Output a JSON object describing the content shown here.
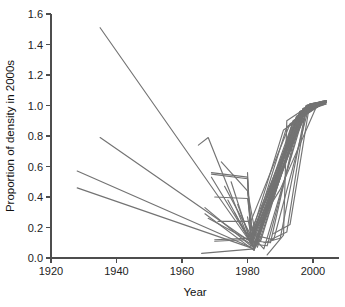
{
  "chart_data": {
    "type": "line",
    "title": "",
    "subtitle": "",
    "xlabel": "Year",
    "ylabel": "Proportion of density in 2000s",
    "xlim": [
      1920,
      2006
    ],
    "ylim": [
      0.0,
      1.6
    ],
    "xticks": [
      1920,
      1940,
      1960,
      1980,
      2000
    ],
    "xticklabels": [
      "1920",
      "1940",
      "1960",
      "1980",
      "2000"
    ],
    "yticks": [
      0.0,
      0.2,
      0.4,
      0.6,
      0.8,
      1.0,
      1.2,
      1.4,
      1.6
    ],
    "yticklabels": [
      "0.0",
      "0.2",
      "0.4",
      "0.6",
      "0.8",
      "1.0",
      "1.2",
      "1.4",
      "1.6"
    ],
    "grid": false,
    "legend": "none",
    "line_color": "#737373",
    "axis_color": "#4d4d4d",
    "background_color": "#ffffff",
    "annotations": [],
    "series": [
      {
        "name": "site-01",
        "x": [
          1935,
          1981,
          1999,
          2004
        ],
        "values": [
          1.51,
          0.1,
          1.01,
          1.03
        ]
      },
      {
        "name": "site-02",
        "x": [
          1928,
          1981,
          1998,
          2004
        ],
        "values": [
          0.57,
          0.07,
          0.99,
          1.02
        ]
      },
      {
        "name": "site-03",
        "x": [
          1928,
          1982,
          1997,
          2004
        ],
        "values": [
          0.46,
          0.06,
          0.97,
          1.01
        ]
      },
      {
        "name": "site-04",
        "x": [
          1935,
          1980,
          1996,
          2003
        ],
        "values": [
          0.79,
          0.12,
          0.95,
          1.02
        ]
      },
      {
        "name": "site-05",
        "x": [
          1965,
          1968,
          1981,
          1997,
          2003
        ],
        "values": [
          0.74,
          0.79,
          0.09,
          0.98,
          1.03
        ]
      },
      {
        "name": "site-06",
        "x": [
          1966,
          1982,
          1995,
          2002
        ],
        "values": [
          0.03,
          0.06,
          0.92,
          1.0
        ]
      },
      {
        "name": "site-07",
        "x": [
          1967,
          1981,
          1996,
          2004
        ],
        "values": [
          0.33,
          0.08,
          0.96,
          1.02
        ]
      },
      {
        "name": "site-08",
        "x": [
          1967,
          1982,
          1998,
          2004
        ],
        "values": [
          0.29,
          0.05,
          1.0,
          1.03
        ]
      },
      {
        "name": "site-09",
        "x": [
          1968,
          1981,
          1994,
          2002
        ],
        "values": [
          0.26,
          0.11,
          0.9,
          1.0
        ]
      },
      {
        "name": "site-10",
        "x": [
          1969,
          1969,
          1982,
          1997,
          2003
        ],
        "values": [
          0.53,
          0.53,
          0.07,
          0.97,
          1.02
        ]
      },
      {
        "name": "site-11",
        "x": [
          1969,
          1980,
          1981,
          1996,
          2004
        ],
        "values": [
          0.55,
          0.52,
          0.13,
          0.95,
          1.01
        ]
      },
      {
        "name": "site-12",
        "x": [
          1970,
          1980,
          1982,
          1995,
          2003
        ],
        "values": [
          0.4,
          0.39,
          0.09,
          0.93,
          1.02
        ]
      },
      {
        "name": "site-13",
        "x": [
          1970,
          1981,
          1997,
          2004
        ],
        "values": [
          0.12,
          0.13,
          0.97,
          1.02
        ]
      },
      {
        "name": "site-14",
        "x": [
          1971,
          1981,
          1993,
          2002
        ],
        "values": [
          0.24,
          0.24,
          0.88,
          1.0
        ]
      },
      {
        "name": "site-15",
        "x": [
          1972,
          1980,
          1982,
          1996,
          2003
        ],
        "values": [
          0.63,
          0.44,
          0.08,
          0.96,
          1.01
        ]
      },
      {
        "name": "site-16",
        "x": [
          1973,
          1981,
          1998,
          2004
        ],
        "values": [
          0.47,
          0.15,
          1.0,
          1.03
        ]
      },
      {
        "name": "site-17",
        "x": [
          1974,
          1982,
          1994,
          2003
        ],
        "values": [
          0.38,
          0.06,
          0.9,
          1.02
        ]
      },
      {
        "name": "site-18",
        "x": [
          1975,
          1981,
          1992,
          2002
        ],
        "values": [
          0.5,
          0.1,
          0.86,
          1.0
        ]
      },
      {
        "name": "site-19",
        "x": [
          1976,
          1982,
          1997,
          2004
        ],
        "values": [
          0.3,
          0.07,
          0.98,
          1.03
        ]
      },
      {
        "name": "site-20",
        "x": [
          1977,
          1981,
          1995,
          2003
        ],
        "values": [
          0.35,
          0.12,
          0.93,
          1.01
        ]
      },
      {
        "name": "site-21",
        "x": [
          1978,
          1982,
          1996,
          2004
        ],
        "values": [
          0.22,
          0.06,
          0.96,
          1.02
        ]
      },
      {
        "name": "site-22",
        "x": [
          1979,
          1981,
          1991,
          2002
        ],
        "values": [
          0.18,
          0.14,
          0.84,
          1.0
        ]
      },
      {
        "name": "site-23",
        "x": [
          1980,
          1982,
          1998,
          2004
        ],
        "values": [
          0.27,
          0.05,
          1.0,
          1.03
        ]
      },
      {
        "name": "site-24",
        "x": [
          1980,
          1983,
          1994,
          2003
        ],
        "values": [
          0.44,
          0.09,
          0.9,
          1.02
        ]
      },
      {
        "name": "site-25",
        "x": [
          1981,
          1983,
          1997,
          2004
        ],
        "values": [
          0.16,
          0.07,
          0.98,
          1.02
        ]
      },
      {
        "name": "site-26",
        "x": [
          1981,
          1984,
          1996,
          2003
        ],
        "values": [
          0.21,
          0.11,
          0.95,
          1.01
        ]
      },
      {
        "name": "site-27",
        "x": [
          1982,
          1985,
          1998,
          2004
        ],
        "values": [
          0.13,
          0.06,
          1.0,
          1.03
        ]
      },
      {
        "name": "site-28",
        "x": [
          1982,
          1986,
          1997,
          2004
        ],
        "values": [
          0.09,
          0.08,
          0.97,
          1.02
        ]
      },
      {
        "name": "site-29",
        "x": [
          1983,
          1987,
          1996,
          2003
        ],
        "values": [
          0.11,
          0.1,
          0.95,
          1.01
        ]
      },
      {
        "name": "site-30",
        "x": [
          1984,
          1988,
          1999,
          2004
        ],
        "values": [
          0.14,
          0.12,
          1.01,
          1.03
        ]
      },
      {
        "name": "site-31",
        "x": [
          1985,
          1990,
          1998,
          2004
        ],
        "values": [
          0.1,
          0.13,
          0.99,
          1.02
        ]
      },
      {
        "name": "site-32",
        "x": [
          1986,
          1991,
          1992,
          1999,
          2004
        ],
        "values": [
          0.02,
          0.15,
          0.9,
          1.0,
          1.03
        ]
      },
      {
        "name": "site-33",
        "x": [
          1987,
          1992,
          1998,
          2004
        ],
        "values": [
          0.12,
          0.17,
          0.99,
          1.02
        ]
      },
      {
        "name": "site-34",
        "x": [
          1988,
          1993,
          1999,
          2004
        ],
        "values": [
          0.16,
          0.22,
          1.01,
          1.03
        ]
      },
      {
        "name": "site-35",
        "x": [
          1980,
          1981,
          1990,
          2001,
          2004
        ],
        "values": [
          0.56,
          0.14,
          0.45,
          0.99,
          1.02
        ]
      },
      {
        "name": "site-36",
        "x": [
          1969,
          1980,
          1981,
          1999,
          2004
        ],
        "values": [
          0.56,
          0.53,
          0.12,
          1.0,
          1.03
        ]
      },
      {
        "name": "site-37",
        "x": [
          1970,
          1979,
          1982,
          1998,
          2004
        ],
        "values": [
          0.11,
          0.12,
          0.08,
          0.99,
          1.02
        ]
      }
    ]
  }
}
